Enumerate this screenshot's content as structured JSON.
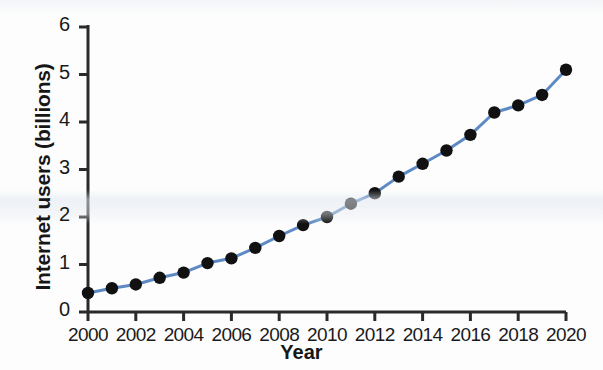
{
  "chart_data": {
    "type": "line",
    "title": "",
    "xlabel": "Year",
    "ylabel": "Internet users (billions)",
    "x": [
      2000,
      2001,
      2002,
      2003,
      2004,
      2005,
      2006,
      2007,
      2008,
      2009,
      2010,
      2011,
      2012,
      2013,
      2014,
      2015,
      2016,
      2017,
      2018,
      2019,
      2020
    ],
    "values": [
      0.4,
      0.5,
      0.58,
      0.72,
      0.83,
      1.03,
      1.13,
      1.35,
      1.6,
      1.83,
      2.0,
      2.28,
      2.5,
      2.85,
      3.12,
      3.4,
      3.73,
      4.2,
      4.35,
      4.57,
      5.1
    ],
    "series": [
      {
        "name": "Internet users",
        "values": [
          0.4,
          0.5,
          0.58,
          0.72,
          0.83,
          1.03,
          1.13,
          1.35,
          1.6,
          1.83,
          2.0,
          2.28,
          2.5,
          2.85,
          3.12,
          3.4,
          3.73,
          4.2,
          4.35,
          4.57,
          5.1
        ]
      }
    ],
    "xlim": [
      2000,
      2020
    ],
    "ylim": [
      0,
      6
    ],
    "x_ticks": [
      2000,
      2002,
      2004,
      2006,
      2008,
      2010,
      2012,
      2014,
      2016,
      2018,
      2020
    ],
    "x_tick_labels": [
      "2000",
      "2002",
      "2004",
      "2006",
      "2008",
      "2010",
      "2012",
      "2014",
      "2016",
      "2018",
      "2020"
    ],
    "y_ticks": [
      0,
      1,
      2,
      3,
      4,
      5,
      6
    ],
    "y_tick_labels": [
      "0",
      "1",
      "2",
      "3",
      "4",
      "5",
      "6"
    ],
    "grid": false,
    "legend": false,
    "legend_position": "none",
    "line_color": "#5d8ac4",
    "marker_color": "#111111",
    "marker_shape": "circle",
    "axis_color": "#2a2a2a",
    "background_color": "#fdfdfd"
  },
  "axes": {
    "y_title": "Internet users (billions)",
    "x_title": "Year"
  }
}
